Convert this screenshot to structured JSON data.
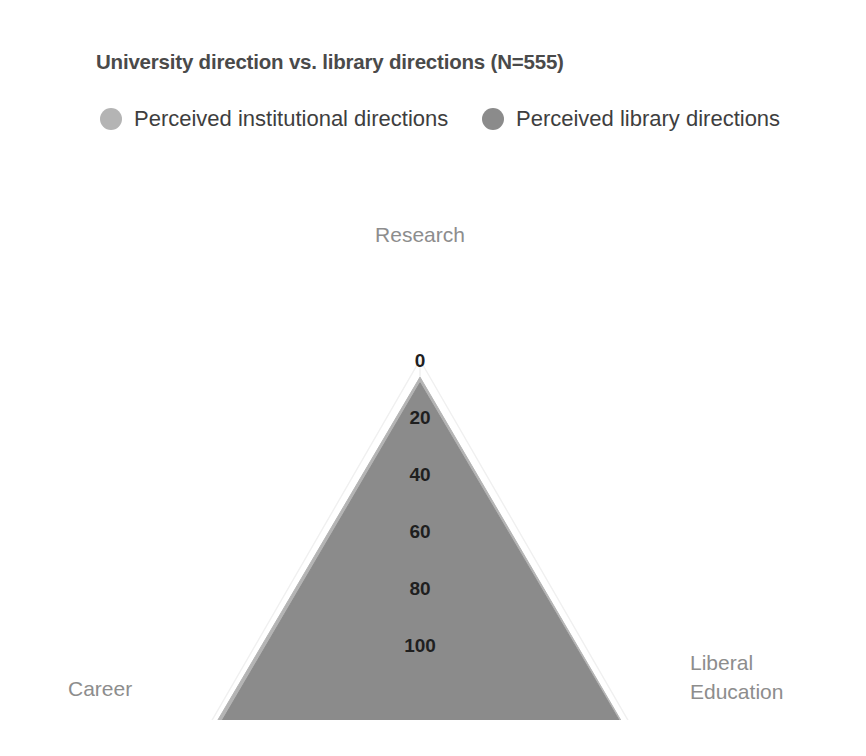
{
  "chart_data": {
    "type": "radar",
    "title": "University direction vs. library directions (N=555)",
    "axes": [
      "Research",
      "Liberal Education",
      "Career"
    ],
    "tick_labels": [
      "100",
      "80",
      "60",
      "40",
      "20",
      "0"
    ],
    "tick_values": [
      100,
      80,
      60,
      40,
      20,
      0
    ],
    "ylim": [
      0,
      100
    ],
    "axis_direction": "reversed (100 at outer apex, 0 at center baseline)",
    "grid": true,
    "legend_position": "top",
    "series": [
      {
        "name": "Perceived institutional directions",
        "color": "#b4b4b4",
        "values": [
          6,
          4,
          3
        ]
      },
      {
        "name": "Perceived library directions",
        "color": "#8b8b8b",
        "values": [
          8,
          5,
          6
        ]
      }
    ]
  },
  "header": {
    "title": "University direction vs. library directions (N=555)"
  },
  "legend": {
    "items": [
      {
        "label": "Perceived institutional directions",
        "color": "#b4b4b4"
      },
      {
        "label": "Perceived library directions",
        "color": "#8b8b8b"
      }
    ]
  },
  "axis_labels": {
    "top": "Research",
    "bottom_left": "Career",
    "bottom_right_line1": "Liberal",
    "bottom_right_line2": "Education"
  },
  "ticks": {
    "t100": "100",
    "t80": "80",
    "t60": "60",
    "t40": "40",
    "t20": "20",
    "t0": "0"
  },
  "colors": {
    "series_light": "#b4b4b4",
    "series_dark": "#8b8b8b",
    "grid": "#f0f0f0",
    "axis_text": "#8d8d8d",
    "tick_text": "#1f1f1f",
    "title_text": "#4a4a4a"
  }
}
